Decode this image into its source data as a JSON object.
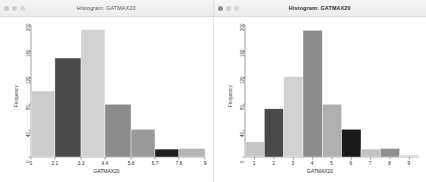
{
  "windows": [
    {
      "id": "left",
      "title": "Histogram: GATMAX20",
      "traffic_lights": [
        "close",
        "minimize",
        "zoom"
      ],
      "chart_data": {
        "type": "bar",
        "title": "",
        "xlabel": "GATMAX20",
        "ylabel": "Frequency",
        "xlim": [
          1,
          9
        ],
        "ylim": [
          0,
          200
        ],
        "grid": false,
        "legend": "none",
        "xtick_labels": [
          "1",
          "2.1",
          "3.3",
          "4.4",
          "5.6",
          "6.7",
          "7.8",
          "9"
        ],
        "xtick_values": [
          1,
          2.1,
          3.3,
          4.4,
          5.6,
          6.7,
          7.8,
          9
        ],
        "ytick_labels": [
          "0",
          "40",
          "80",
          "120",
          "160",
          "200"
        ],
        "ytick_values": [
          0,
          40,
          80,
          120,
          160,
          200
        ],
        "bin_edges": [
          1,
          2.1,
          3.3,
          4.4,
          5.6,
          6.7,
          7.8,
          9
        ],
        "categories": [
          "1-2.1",
          "2.1-3.3",
          "3.3-4.4",
          "4.4-5.6",
          "5.6-6.7",
          "6.7-7.8",
          "7.8-9"
        ],
        "values": [
          100,
          150,
          193,
          80,
          42,
          12,
          13
        ],
        "bar_colors": [
          "#cccccc",
          "#4a4a4a",
          "#d2d2d2",
          "#8c8c8c",
          "#9a9a9a",
          "#1e1e1e",
          "#b5b5b5"
        ]
      }
    },
    {
      "id": "right",
      "title": "Histogram: GATMAX20",
      "traffic_lights": [
        "close",
        "minimize",
        "zoom"
      ],
      "chart_data": {
        "type": "bar",
        "title": "",
        "xlabel": "GATMAX20",
        "ylabel": "Frequency",
        "xlim": [
          0.5,
          9.5
        ],
        "ylim": [
          0,
          200
        ],
        "grid": false,
        "legend": "none",
        "xtick_labels": [
          "1",
          "2",
          "3",
          "4",
          "5",
          "6",
          "7",
          "8",
          "9"
        ],
        "xtick_values": [
          1,
          2,
          3,
          4,
          5,
          6,
          7,
          8,
          9
        ],
        "ytick_labels": [
          "0",
          "40",
          "80",
          "120",
          "160",
          "200"
        ],
        "ytick_values": [
          0,
          40,
          80,
          120,
          160,
          200
        ],
        "categories": [
          "1",
          "2",
          "3",
          "4",
          "5",
          "6",
          "7",
          "8",
          "9"
        ],
        "values": [
          23,
          73,
          122,
          192,
          80,
          42,
          12,
          13,
          3
        ],
        "bar_colors": [
          "#c6c6c6",
          "#4a4a4a",
          "#d2d2d2",
          "#8c8c8c",
          "#b0b0b0",
          "#1a1a1a",
          "#c2c2c2",
          "#909090",
          "#d8d8d8"
        ]
      }
    }
  ]
}
